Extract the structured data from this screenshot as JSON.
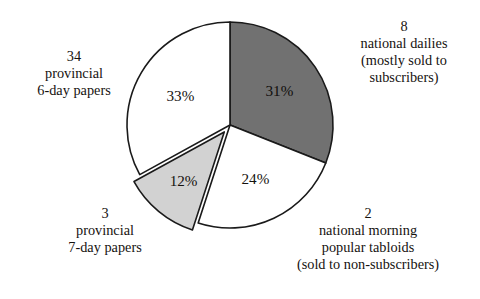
{
  "chart_data": {
    "type": "pie",
    "title": "",
    "subtitle": "",
    "xlabel": "",
    "ylabel": "",
    "legend_position": "callouts-around-pie",
    "grid": false,
    "start_angle_deg": 0,
    "direction": "clockwise",
    "total_percent": 100,
    "categories": [
      "8 national dailies (mostly sold to subscribers)",
      "2 national morning popular tabloids (sold to non-subscribers)",
      "3 provincial 7-day papers",
      "34 provincial 6-day papers"
    ],
    "values": [
      31,
      24,
      12,
      33
    ],
    "slices": [
      {
        "id": "national-dailies",
        "percent": 31,
        "value_label": "31%",
        "count": "8",
        "lines": [
          "national dailies",
          "(mostly sold to",
          "subscribers)"
        ],
        "fill": "#717171",
        "stroke": "#1a1a1a",
        "exploded": false,
        "start_deg": 0,
        "end_deg": 111.6,
        "label_color": "#100d0b"
      },
      {
        "id": "national-tabloids",
        "percent": 24,
        "value_label": "24%",
        "count": "2",
        "lines": [
          "national morning",
          "popular tabloids",
          "(sold to non-subscribers)"
        ],
        "fill": "#ffffff",
        "stroke": "#1a1a1a",
        "exploded": false,
        "start_deg": 111.6,
        "end_deg": 198.0,
        "label_color": "#15110e"
      },
      {
        "id": "provincial-7day",
        "percent": 12,
        "value_label": "12%",
        "count": "3",
        "lines": [
          "provincial",
          "7-day papers"
        ],
        "fill": "#d2d2d2",
        "stroke": "#1a1a1a",
        "exploded": true,
        "start_deg": 198.0,
        "end_deg": 241.2,
        "label_color": "#15110e"
      },
      {
        "id": "provincial-6day",
        "percent": 33,
        "value_label": "33%",
        "count": "34",
        "lines": [
          "provincial",
          "6-day papers"
        ],
        "fill": "#ffffff",
        "stroke": "#1a1a1a",
        "exploded": false,
        "start_deg": 241.2,
        "end_deg": 360.0,
        "label_color": "#15110e"
      }
    ]
  },
  "pie": {
    "center_x": 230,
    "center_y": 125,
    "radius": 103,
    "explode_offset": 9
  },
  "labels": {
    "pct_31": "31%",
    "pct_24": "24%",
    "pct_12": "12%",
    "pct_33": "33%"
  },
  "callouts": {
    "national_dailies": {
      "count": "8",
      "line1": "national dailies",
      "line2": "(mostly sold to",
      "line3": "subscribers)"
    },
    "national_tabloids": {
      "count": "2",
      "line1": "national morning",
      "line2": "popular tabloids",
      "line3": "(sold to non-subscribers)"
    },
    "provincial_7day": {
      "count": "3",
      "line1": "provincial",
      "line2": "7-day papers"
    },
    "provincial_6day": {
      "count": "34",
      "line1": "provincial",
      "line2": "6-day papers"
    }
  },
  "colors": {
    "dark_slice": "#717171",
    "light_slice": "#d2d2d2",
    "white_slice": "#ffffff",
    "outline": "#1a1a1a",
    "text": "#16120f",
    "background": "#ffffff"
  }
}
